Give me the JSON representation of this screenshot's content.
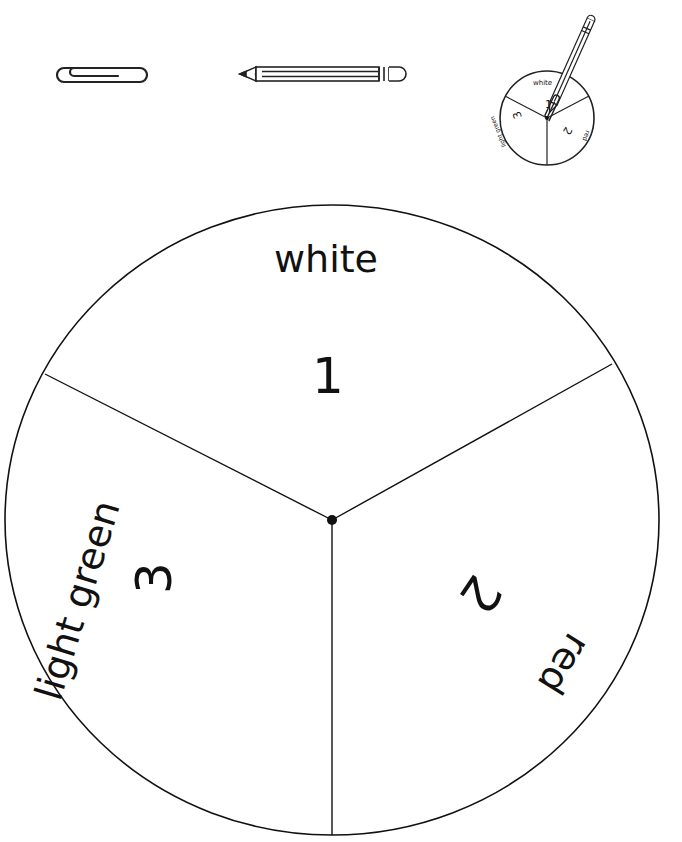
{
  "materials": {
    "items": [
      {
        "name": "paper clip",
        "icon": "paperclip-icon"
      },
      {
        "name": "pencil",
        "icon": "pencil-icon"
      },
      {
        "name": "spinner example",
        "icon": "spinner-example-icon"
      }
    ]
  },
  "example_spinner": {
    "sections": [
      {
        "number": "1",
        "color_label": "white"
      },
      {
        "number": "2",
        "color_label": "red"
      },
      {
        "number": "3",
        "color_label": "light green"
      }
    ]
  },
  "spinner": {
    "sections": [
      {
        "number": "1",
        "color_label": "white"
      },
      {
        "number": "2",
        "color_label": "red"
      },
      {
        "number": "3",
        "color_label": "light green"
      }
    ],
    "stroke_color": "#111111",
    "fill_color": "#ffffff"
  }
}
